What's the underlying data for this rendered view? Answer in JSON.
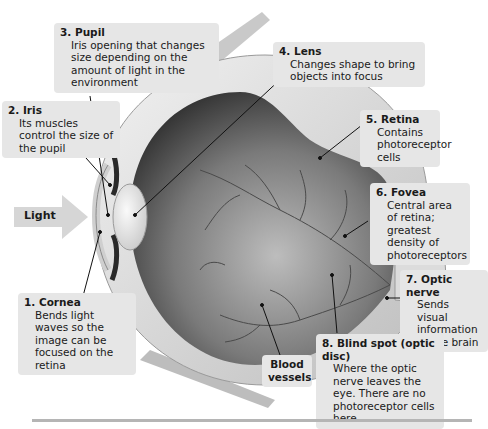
{
  "figure": {
    "light_arrow_label": "Light",
    "labels": [
      {
        "id": "cornea",
        "number": "1.",
        "name": "Cornea",
        "description": "Bends light waves so the image can be focused on the retina"
      },
      {
        "id": "iris",
        "number": "2.",
        "name": "Iris",
        "description": "Its muscles control the size of the pupil"
      },
      {
        "id": "pupil",
        "number": "3.",
        "name": "Pupil",
        "description": "Iris opening that changes size depending on the amount of light in the environment"
      },
      {
        "id": "lens",
        "number": "4.",
        "name": "Lens",
        "description": "Changes shape to bring objects into focus"
      },
      {
        "id": "retina",
        "number": "5.",
        "name": "Retina",
        "description": "Contains photoreceptor cells"
      },
      {
        "id": "fovea",
        "number": "6.",
        "name": "Fovea",
        "description": "Central area of retina; greatest density of photoreceptors"
      },
      {
        "id": "optic-nerve",
        "number": "7.",
        "name": "Optic nerve",
        "description": "Sends visual information to the brain"
      },
      {
        "id": "blind-spot",
        "number": "8.",
        "name": "Blind spot (optic disc)",
        "description": "Where the optic nerve leaves the eye. There are no photoreceptor cells here"
      },
      {
        "id": "blood-vessels",
        "number": "",
        "name": "Blood vessels",
        "description": ""
      }
    ]
  },
  "colors": {
    "label_bg": "#e6e6e6",
    "eye_outer": "#d9d9d9",
    "eye_inner_dark": "#3a3a3a",
    "vessels": "#4a4a4a",
    "rule": "#b5b5b5"
  }
}
